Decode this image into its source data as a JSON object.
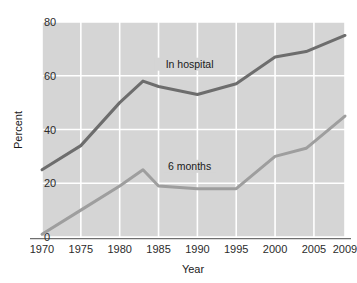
{
  "chart_data": {
    "type": "line",
    "title": "",
    "xlabel": "Year",
    "ylabel": "Percent",
    "xlim": [
      1970,
      2009
    ],
    "ylim": [
      0,
      80
    ],
    "xticks": [
      1970,
      1975,
      1980,
      1985,
      1990,
      1995,
      2000,
      2005,
      2009
    ],
    "xtick_labels": [
      "1970",
      "1975",
      "1980",
      "1985",
      "1990",
      "1995",
      "2000",
      "2005",
      "2009"
    ],
    "yticks": [
      0,
      20,
      40,
      60,
      80
    ],
    "ytick_labels": [
      "0",
      "20",
      "40",
      "60",
      "80"
    ],
    "grid": true,
    "grid_color": "#ffffff",
    "plot_background": "#d5d5d5",
    "legend_position": "inline-labels",
    "series": [
      {
        "name": "In hospital",
        "color": "#6d6d6d",
        "label_x": 1989,
        "label_y": 63,
        "x": [
          1970,
          1975,
          1980,
          1983,
          1985,
          1990,
          1995,
          2000,
          2004,
          2009
        ],
        "values": [
          25,
          34,
          50,
          58,
          56,
          53,
          57,
          67,
          69,
          75
        ]
      },
      {
        "name": "6 months",
        "color": "#9e9e9e",
        "label_x": 1989,
        "label_y": 25,
        "x": [
          1970,
          1975,
          1980,
          1983,
          1985,
          1990,
          1995,
          2000,
          2004,
          2009
        ],
        "values": [
          1,
          10,
          19,
          25,
          19,
          18,
          18,
          30,
          33,
          45
        ]
      }
    ]
  },
  "axes": {
    "y_axis_title": "Percent",
    "x_axis_title": "Year"
  }
}
